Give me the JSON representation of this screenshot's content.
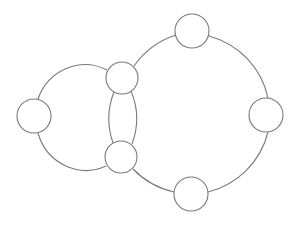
{
  "diagram": {
    "type": "graph",
    "stroke_color": "#7a7a7a",
    "fill_color": "#ffffff",
    "nodes": [
      {
        "id": "A",
        "cx": 34,
        "cy": 116,
        "r": 17
      },
      {
        "id": "B",
        "cx": 122,
        "cy": 78,
        "r": 16
      },
      {
        "id": "C",
        "cx": 121,
        "cy": 157,
        "r": 16
      },
      {
        "id": "D",
        "cx": 192,
        "cy": 31,
        "r": 17
      },
      {
        "id": "E",
        "cx": 266,
        "cy": 115,
        "r": 17
      },
      {
        "id": "F",
        "cx": 191,
        "cy": 194,
        "r": 17
      }
    ],
    "edges": [
      {
        "from": "A",
        "to": "B",
        "shape": "arc"
      },
      {
        "from": "A",
        "to": "C",
        "shape": "arc"
      },
      {
        "from": "B",
        "to": "C",
        "shape": "arc-left"
      },
      {
        "from": "B",
        "to": "C",
        "shape": "arc-right"
      },
      {
        "from": "B",
        "to": "D",
        "shape": "arc"
      },
      {
        "from": "D",
        "to": "E",
        "shape": "arc"
      },
      {
        "from": "E",
        "to": "F",
        "shape": "arc"
      },
      {
        "from": "F",
        "to": "C",
        "shape": "arc"
      }
    ]
  }
}
